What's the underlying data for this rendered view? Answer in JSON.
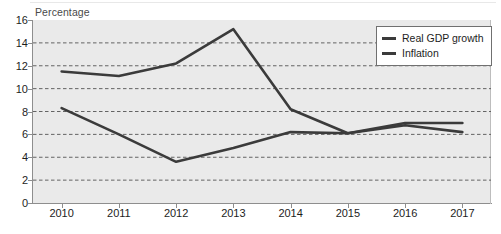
{
  "axis_title": "Percentage",
  "legend": {
    "position": "top-right",
    "entries": [
      {
        "label": "Real GDP growth",
        "color": "#3b3b3b"
      },
      {
        "label": "Inflation",
        "color": "#3b3b3b"
      }
    ]
  },
  "chart_data": {
    "type": "line",
    "title": "",
    "subtitle": "",
    "xlabel": "",
    "ylabel": "Percentage",
    "categories": [
      "2010",
      "2011",
      "2012",
      "2013",
      "2014",
      "2015",
      "2016",
      "2017"
    ],
    "x_tick_labels": [
      "2010",
      "2011",
      "2012",
      "2013",
      "2014",
      "2015",
      "2016",
      "2017"
    ],
    "y_tick_labels": [
      "0",
      "2",
      "4",
      "6",
      "8",
      "10",
      "12",
      "14",
      "16"
    ],
    "y_ticks": [
      0,
      2,
      4,
      6,
      8,
      10,
      12,
      14,
      16
    ],
    "ylim": [
      0,
      16
    ],
    "grid": "horizontal-dashed",
    "plot_background": "#eaeaea",
    "legend_position": "top-right",
    "series": [
      {
        "name": "Real GDP growth",
        "color": "#3b3b3b",
        "values": [
          8.3,
          6.0,
          3.6,
          4.8,
          6.2,
          6.1,
          6.8,
          6.2
        ]
      },
      {
        "name": "Inflation",
        "color": "#3b3b3b",
        "values": [
          11.5,
          11.1,
          12.2,
          15.2,
          8.2,
          6.1,
          7.0,
          7.0
        ]
      }
    ]
  }
}
